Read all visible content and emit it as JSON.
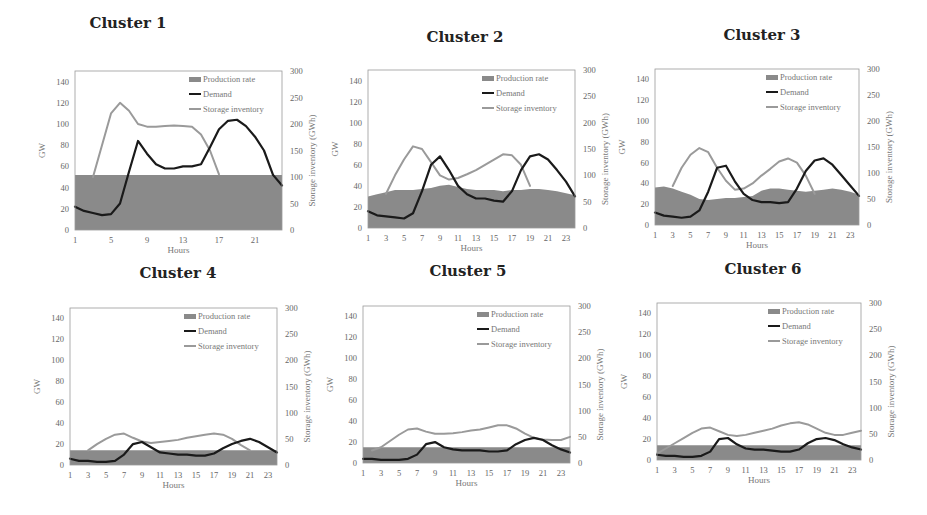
{
  "figure": {
    "legend": {
      "production": "Production rate",
      "demand": "Demand",
      "storage": "Storage inventory"
    },
    "xlabel": "Hours",
    "ylabel_left": "GW",
    "ylabel_right": "Storage inventory (GWh)",
    "colors": {
      "production_fill": "#8a8a8a",
      "demand_line": "#1a1a1a",
      "storage_line": "#9a9a9a",
      "frame": "#999999"
    }
  },
  "chart_data": [
    {
      "type": "line",
      "title": "Cluster 1",
      "xlabel": "Hours",
      "ylabel": "GW",
      "ylabel_right": "Storage inventory (GWh)",
      "x": [
        1,
        2,
        3,
        4,
        5,
        6,
        7,
        8,
        9,
        10,
        11,
        12,
        13,
        14,
        15,
        16,
        17,
        18,
        19,
        20,
        21,
        22,
        23,
        24
      ],
      "xticks": [
        1,
        5,
        9,
        13,
        17,
        21
      ],
      "ylim": [
        0,
        150
      ],
      "yticks": [
        0,
        20,
        40,
        60,
        80,
        100,
        120,
        140
      ],
      "ylim_right": [
        0,
        300
      ],
      "yticks_right": [
        0,
        50,
        100,
        150,
        200,
        250,
        300
      ],
      "legend_position": "upper right",
      "grid": false,
      "series": [
        {
          "name": "Production rate",
          "type": "area",
          "axis": "left",
          "values": [
            52,
            52,
            52,
            52,
            52,
            52,
            52,
            52,
            52,
            52,
            52,
            52,
            52,
            52,
            52,
            52,
            52,
            52,
            52,
            52,
            52,
            52,
            52,
            52
          ]
        },
        {
          "name": "Demand",
          "type": "line",
          "axis": "left",
          "values": [
            22,
            18,
            16,
            14,
            15,
            25,
            55,
            84,
            72,
            62,
            58,
            58,
            60,
            60,
            62,
            78,
            95,
            103,
            104,
            98,
            88,
            75,
            52,
            42
          ]
        },
        {
          "name": "Storage inventory",
          "type": "line",
          "axis": "right",
          "values": [
            null,
            null,
            100,
            160,
            220,
            240,
            225,
            200,
            195,
            195,
            196,
            197,
            196,
            195,
            180,
            150,
            105,
            null,
            null,
            null,
            null,
            null,
            null,
            null
          ]
        }
      ]
    },
    {
      "type": "line",
      "title": "Cluster 2",
      "xlabel": "Hours",
      "ylabel": "GW",
      "ylabel_right": "Storage inventory (GWh)",
      "x": [
        1,
        2,
        3,
        4,
        5,
        6,
        7,
        8,
        9,
        10,
        11,
        12,
        13,
        14,
        15,
        16,
        17,
        18,
        19,
        20,
        21,
        22,
        23,
        24
      ],
      "xticks": [
        1,
        3,
        5,
        7,
        9,
        11,
        13,
        15,
        17,
        19,
        21,
        23
      ],
      "ylim": [
        0,
        150
      ],
      "yticks": [
        0,
        20,
        40,
        60,
        80,
        100,
        120,
        140
      ],
      "ylim_right": [
        0,
        300
      ],
      "yticks_right": [
        0,
        50,
        100,
        150,
        200,
        250,
        300
      ],
      "legend_position": "upper right",
      "grid": false,
      "series": [
        {
          "name": "Production rate",
          "type": "area",
          "axis": "left",
          "values": [
            30,
            32,
            34,
            36,
            36,
            36,
            37,
            38,
            40,
            41,
            39,
            37,
            36,
            36,
            36,
            35,
            36,
            36,
            37,
            37,
            36,
            35,
            33,
            31
          ]
        },
        {
          "name": "Demand",
          "type": "line",
          "axis": "left",
          "values": [
            16,
            12,
            11,
            10,
            9,
            14,
            35,
            60,
            68,
            55,
            40,
            32,
            28,
            28,
            26,
            25,
            35,
            55,
            68,
            70,
            65,
            55,
            44,
            30
          ]
        },
        {
          "name": "Storage inventory",
          "type": "line",
          "axis": "right",
          "values": [
            null,
            null,
            65,
            100,
            130,
            155,
            150,
            125,
            100,
            92,
            95,
            102,
            110,
            120,
            130,
            140,
            138,
            120,
            80,
            null,
            null,
            null,
            null,
            null
          ]
        }
      ]
    },
    {
      "type": "line",
      "title": "Cluster 3",
      "xlabel": "Hours",
      "ylabel": "GW",
      "ylabel_right": "Storage inventory (GWh)",
      "x": [
        1,
        2,
        3,
        4,
        5,
        6,
        7,
        8,
        9,
        10,
        11,
        12,
        13,
        14,
        15,
        16,
        17,
        18,
        19,
        20,
        21,
        22,
        23,
        24
      ],
      "xticks": [
        1,
        3,
        5,
        7,
        9,
        11,
        13,
        15,
        17,
        19,
        21,
        23
      ],
      "ylim": [
        0,
        150
      ],
      "yticks": [
        0,
        20,
        40,
        60,
        80,
        100,
        120,
        140
      ],
      "ylim_right": [
        0,
        300
      ],
      "yticks_right": [
        0,
        50,
        100,
        150,
        200,
        250,
        300
      ],
      "legend_position": "upper right",
      "grid": false,
      "series": [
        {
          "name": "Production rate",
          "type": "area",
          "axis": "left",
          "values": [
            36,
            37,
            35,
            32,
            29,
            25,
            24,
            25,
            26,
            26,
            27,
            28,
            33,
            35,
            35,
            34,
            33,
            32,
            33,
            34,
            35,
            34,
            32,
            29
          ]
        },
        {
          "name": "Demand",
          "type": "line",
          "axis": "left",
          "values": [
            12,
            9,
            8,
            7,
            8,
            14,
            32,
            55,
            57,
            42,
            30,
            24,
            22,
            22,
            21,
            22,
            35,
            52,
            62,
            64,
            58,
            48,
            38,
            28
          ]
        },
        {
          "name": "Storage inventory",
          "type": "line",
          "axis": "right",
          "values": [
            null,
            null,
            75,
            110,
            135,
            148,
            140,
            110,
            85,
            68,
            70,
            80,
            95,
            108,
            122,
            128,
            120,
            95,
            60,
            null,
            null,
            null,
            null,
            null
          ]
        }
      ]
    },
    {
      "type": "line",
      "title": "Cluster 4",
      "xlabel": "Hours",
      "ylabel": "GW",
      "ylabel_right": "Storage inventory (GWh)",
      "x": [
        1,
        2,
        3,
        4,
        5,
        6,
        7,
        8,
        9,
        10,
        11,
        12,
        13,
        14,
        15,
        16,
        17,
        18,
        19,
        20,
        21,
        22,
        23,
        24
      ],
      "xticks": [
        1,
        3,
        5,
        7,
        9,
        11,
        13,
        15,
        17,
        19,
        21,
        23
      ],
      "ylim": [
        0,
        150
      ],
      "yticks": [
        0,
        20,
        40,
        60,
        80,
        100,
        120,
        140
      ],
      "ylim_right": [
        0,
        300
      ],
      "yticks_right": [
        0,
        50,
        100,
        150,
        200,
        250,
        300
      ],
      "legend_position": "upper right",
      "grid": false,
      "series": [
        {
          "name": "Production rate",
          "type": "area",
          "axis": "left",
          "values": [
            14,
            14,
            14,
            14,
            14,
            14,
            14,
            14,
            14,
            14,
            14,
            14,
            14,
            14,
            14,
            14,
            14,
            14,
            14,
            14,
            14,
            14,
            14,
            14
          ]
        },
        {
          "name": "Demand",
          "type": "line",
          "axis": "left",
          "values": [
            6,
            4,
            4,
            3,
            3,
            4,
            10,
            20,
            22,
            17,
            12,
            11,
            10,
            10,
            9,
            9,
            11,
            16,
            20,
            23,
            25,
            22,
            17,
            12
          ]
        },
        {
          "name": "Storage inventory",
          "type": "line",
          "axis": "right",
          "values": [
            null,
            null,
            28,
            40,
            50,
            58,
            60,
            52,
            45,
            42,
            44,
            46,
            48,
            52,
            55,
            58,
            60,
            58,
            50,
            38,
            28,
            null,
            null,
            null
          ]
        }
      ]
    },
    {
      "type": "line",
      "title": "Cluster 5",
      "xlabel": "Hours",
      "ylabel": "GW",
      "ylabel_right": "Storage inventory (GWh)",
      "x": [
        1,
        2,
        3,
        4,
        5,
        6,
        7,
        8,
        9,
        10,
        11,
        12,
        13,
        14,
        15,
        16,
        17,
        18,
        19,
        20,
        21,
        22,
        23,
        24
      ],
      "xticks": [
        1,
        3,
        5,
        7,
        9,
        11,
        13,
        15,
        17,
        19,
        21,
        23
      ],
      "ylim": [
        0,
        150
      ],
      "yticks": [
        0,
        20,
        40,
        60,
        80,
        100,
        120,
        140
      ],
      "ylim_right": [
        0,
        300
      ],
      "yticks_right": [
        0,
        50,
        100,
        150,
        200,
        250,
        300
      ],
      "legend_position": "upper right",
      "grid": false,
      "series": [
        {
          "name": "Production rate",
          "type": "area",
          "axis": "left",
          "values": [
            15,
            15,
            15,
            15,
            15,
            15,
            15,
            15,
            15,
            15,
            15,
            15,
            15,
            15,
            15,
            15,
            15,
            15,
            15,
            15,
            15,
            15,
            15,
            15
          ]
        },
        {
          "name": "Demand",
          "type": "line",
          "axis": "left",
          "values": [
            4,
            4,
            3,
            3,
            3,
            4,
            8,
            18,
            20,
            15,
            13,
            12,
            12,
            12,
            11,
            11,
            12,
            18,
            22,
            24,
            22,
            17,
            13,
            10
          ]
        },
        {
          "name": "Storage inventory",
          "type": "line",
          "axis": "right",
          "values": [
            null,
            24,
            30,
            42,
            54,
            64,
            66,
            60,
            56,
            56,
            57,
            59,
            62,
            64,
            68,
            72,
            72,
            66,
            56,
            48,
            45,
            44,
            44,
            50
          ]
        }
      ]
    },
    {
      "type": "line",
      "title": "Cluster 6",
      "xlabel": "Hours",
      "ylabel": "GW",
      "ylabel_right": "Storage inventory (GWh)",
      "x": [
        1,
        2,
        3,
        4,
        5,
        6,
        7,
        8,
        9,
        10,
        11,
        12,
        13,
        14,
        15,
        16,
        17,
        18,
        19,
        20,
        21,
        22,
        23,
        24
      ],
      "xticks": [
        1,
        3,
        5,
        7,
        9,
        11,
        13,
        15,
        17,
        19,
        21,
        23
      ],
      "ylim": [
        0,
        150
      ],
      "yticks": [
        0,
        20,
        40,
        60,
        80,
        100,
        120,
        140
      ],
      "ylim_right": [
        0,
        300
      ],
      "yticks_right": [
        0,
        50,
        100,
        150,
        200,
        250,
        300
      ],
      "legend_position": "upper right",
      "grid": false,
      "series": [
        {
          "name": "Production rate",
          "type": "area",
          "axis": "left",
          "values": [
            14,
            14,
            14,
            14,
            14,
            14,
            14,
            14,
            14,
            14,
            14,
            14,
            14,
            14,
            14,
            14,
            14,
            14,
            14,
            14,
            14,
            14,
            14,
            14
          ]
        },
        {
          "name": "Demand",
          "type": "line",
          "axis": "left",
          "values": [
            5,
            4,
            4,
            3,
            3,
            4,
            8,
            20,
            21,
            15,
            11,
            10,
            10,
            9,
            8,
            8,
            10,
            16,
            20,
            21,
            19,
            15,
            12,
            10
          ]
        },
        {
          "name": "Storage inventory",
          "type": "line",
          "axis": "right",
          "values": [
            12,
            22,
            32,
            42,
            52,
            60,
            62,
            55,
            48,
            46,
            48,
            52,
            56,
            60,
            66,
            70,
            72,
            68,
            60,
            52,
            48,
            48,
            52,
            56
          ]
        }
      ]
    }
  ]
}
